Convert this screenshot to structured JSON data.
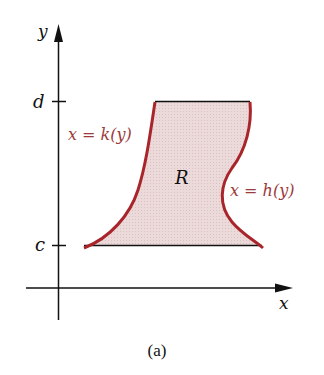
{
  "figure": {
    "caption": "(a)",
    "axes": {
      "x_label": "x",
      "y_label": "y",
      "y_ticks": [
        {
          "label": "d",
          "position": "upper"
        },
        {
          "label": "c",
          "position": "lower"
        }
      ]
    },
    "region": {
      "label": "R",
      "fill_color": "#ead6d5"
    },
    "curves": {
      "left": {
        "label": "x = k(y)",
        "color": "#a8262b"
      },
      "right": {
        "label": "x = h(y)",
        "color": "#a8262b"
      }
    },
    "label_color": "#9b3b3b",
    "axis_color": "#111111"
  }
}
